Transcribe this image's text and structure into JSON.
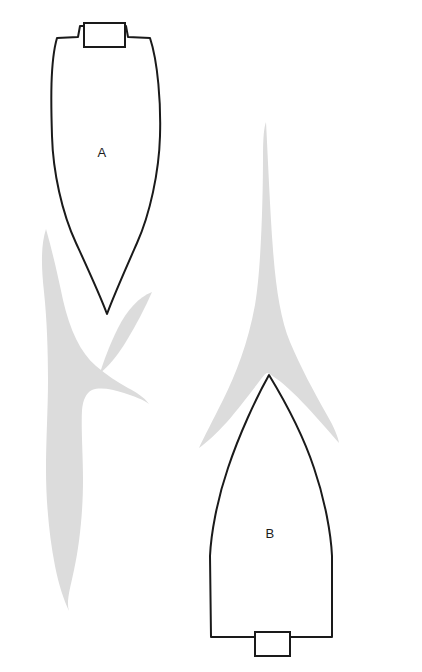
{
  "figure": {
    "background_color": "#ffffff",
    "canvas": {
      "width": 422,
      "height": 672
    },
    "outline_color": "#1a1a1a",
    "wake_color": "#dcdcdc",
    "label_color": "#1c1c1c"
  },
  "hulls": [
    {
      "id": "hull-a",
      "label": "A",
      "label_x": 102,
      "label_y": 154,
      "description": "Narrow fine-entry hull, transom at top, pointed bow at bottom",
      "transom": {
        "x": 84,
        "y": 23,
        "width": 41,
        "height": 24
      },
      "outline_path": "M 57 38 L 78 37 L 80 26 L 126 26 L 128 37 L 150 38 C 158 62 161 104 160 136 C 159 172 150 214 137 243 C 126 268 114 295 107 314 C 100 295 87 267 76 243 C 62 213 53 172 52 136 C 51 104 50 62 57 38 Z",
      "tip": {
        "x": 107,
        "y": 314
      },
      "beam_left": 52,
      "beam_right": 161
    },
    {
      "id": "hull-b",
      "label": "B",
      "label_x": 270,
      "label_y": 535,
      "description": "Broad beam hull, sharp bow at top, wide transom at bottom",
      "transom": {
        "x": 255,
        "y": 632,
        "width": 35,
        "height": 24
      },
      "outline_path": "M 269 375 C 283 398 303 435 314 468 C 325 500 331 534 332 556 L 332 637 L 290 637 L 290 632 L 255 632 L 255 637 L 211 637 L 210 556 C 211 534 217 500 228 468 C 239 435 256 398 269 375 Z",
      "tip": {
        "x": 269,
        "y": 375
      },
      "beam_left": 210,
      "beam_right": 332
    }
  ],
  "wakes": [
    {
      "id": "wake-a",
      "belongs_to": "A",
      "color": "#dcdcdc",
      "description": "Long sweeping divergent bow wave trailing aft from hull A, splitting into two lobes",
      "path": "M 46 229 C 52 250 58 276 63 300 C 70 330 80 352 96 366 C 107 375 117 382 128 388 C 136 392 144 397 149 404 C 144 400 134 396 124 393 C 112 389 100 387 92 390 C 86 393 83 400 82 410 C 81 428 83 456 83 480 C 83 509 80 543 74 570 C 70 589 66 602 69 611 C 64 600 59 586 55 566 C 49 536 46 500 46 470 C 46 440 48 408 48 380 C 48 352 47 320 44 292 C 41 265 41 244 46 229 Z"
    },
    {
      "id": "wake-a-right",
      "belongs_to": "A",
      "color": "#dcdcdc",
      "description": "Short forward lobe of hull A bow wave on the starboard side",
      "path": "M 152 292 C 145 308 136 325 127 340 C 118 355 109 366 100 373 C 104 360 110 344 118 328 C 127 310 139 297 152 292 Z"
    },
    {
      "id": "wake-b",
      "belongs_to": "B",
      "color": "#dcdcdc",
      "description": "Tall narrow divergent bow wave ahead of hull B forming a wide V around the bow",
      "path": "M 266 122 C 268 160 270 210 273 250 C 276 290 281 320 290 342 C 300 366 314 392 327 415 C 334 427 338 437 339 443 C 332 435 320 421 307 407 C 294 393 282 382 274 377 C 270 374 268 373 267 373 C 266 373 264 375 261 379 C 252 391 239 408 227 422 C 216 434 206 443 199 448 C 204 437 213 420 223 400 C 236 374 248 343 255 305 C 261 270 263 200 263 155 C 263 138 264 127 266 122 Z"
    }
  ]
}
